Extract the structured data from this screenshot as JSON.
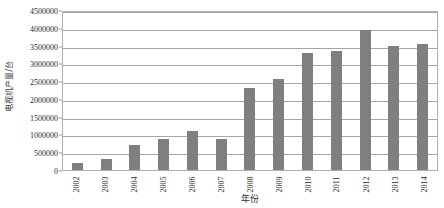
{
  "chart_data": {
    "type": "bar",
    "title": "",
    "xlabel": "年份",
    "ylabel": "电视机产量/台",
    "categories": [
      "2002",
      "2003",
      "2004",
      "2005",
      "2006",
      "2007",
      "2008",
      "2009",
      "2010",
      "2011",
      "2012",
      "2013",
      "2014"
    ],
    "values": [
      200000,
      300000,
      700000,
      880000,
      1110000,
      870000,
      2300000,
      2550000,
      3300000,
      3350000,
      3950000,
      3500000,
      3550000
    ],
    "ylim": [
      0,
      4500000
    ],
    "ytick_step": 500000,
    "yticks": [
      "4500000",
      "4000000",
      "3500000",
      "3000000",
      "2500000",
      "2000000",
      "1500000",
      "1000000",
      "500000",
      "0"
    ],
    "ytick_values": [
      4500000,
      4000000,
      3500000,
      3000000,
      2500000,
      2000000,
      1500000,
      1000000,
      500000,
      0
    ],
    "grid": true,
    "legend": false,
    "legend_position": "none",
    "series_color": "#7f7f7f",
    "gridline_color": "#a6a6a6",
    "plot_border_color": "#b0b0b0",
    "axis_text_color": "#2b2b2b"
  }
}
